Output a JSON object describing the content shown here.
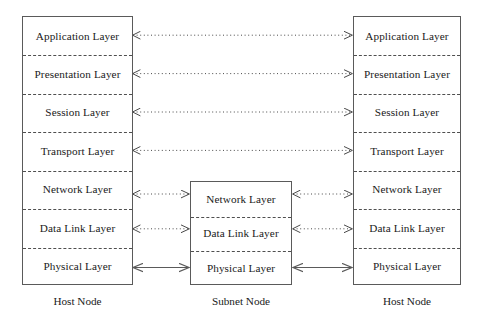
{
  "diagram": {
    "background_color": "#ffffff",
    "line_color": "#5a5a5a",
    "text_color": "#1a1a1a",
    "nodes": [
      {
        "id": "host-left",
        "caption": "Host Node",
        "layers": [
          "Application Layer",
          "Presentation Layer",
          "Session Layer",
          "Transport Layer",
          "Network Layer",
          "Data Link Layer",
          "Physical Layer"
        ]
      },
      {
        "id": "subnet-middle",
        "caption": "Subnet Node",
        "layers": [
          "Network Layer",
          "Data Link Layer",
          "Physical Layer"
        ]
      },
      {
        "id": "host-right",
        "caption": "Host Node",
        "layers": [
          "Application Layer",
          "Presentation Layer",
          "Session Layer",
          "Transport Layer",
          "Network Layer",
          "Data Link Layer",
          "Physical Layer"
        ]
      }
    ],
    "connections": [
      {
        "id": "peer-application",
        "label": "Application Layer",
        "style": "dotted",
        "span": "host-left-to-host-right"
      },
      {
        "id": "peer-presentation",
        "label": "Presentation Layer",
        "style": "dotted",
        "span": "host-left-to-host-right"
      },
      {
        "id": "peer-session",
        "label": "Session Layer",
        "style": "dotted",
        "span": "host-left-to-host-right"
      },
      {
        "id": "peer-transport",
        "label": "Transport Layer",
        "style": "dotted",
        "span": "host-left-to-host-right"
      },
      {
        "id": "left-network",
        "label": "Network Layer",
        "style": "dotted",
        "span": "host-left-to-subnet"
      },
      {
        "id": "left-datalink",
        "label": "Data Link Layer",
        "style": "dotted",
        "span": "host-left-to-subnet"
      },
      {
        "id": "left-physical",
        "label": "Physical Layer",
        "style": "solid",
        "span": "host-left-to-subnet"
      },
      {
        "id": "right-network",
        "label": "Network Layer",
        "style": "dotted",
        "span": "subnet-to-host-right"
      },
      {
        "id": "right-datalink",
        "label": "Data Link Layer",
        "style": "dotted",
        "span": "subnet-to-host-right"
      },
      {
        "id": "right-physical",
        "label": "Physical Layer",
        "style": "solid",
        "span": "subnet-to-host-right"
      }
    ]
  }
}
